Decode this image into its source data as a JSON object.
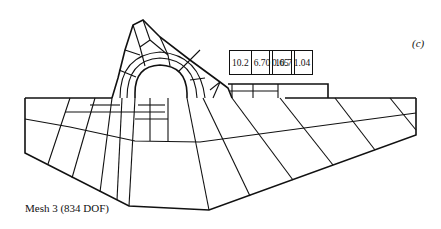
{
  "figure": {
    "panel_label": "(c)",
    "caption": "Mesh 3 (834 DOF)",
    "value_boxes": [
      {
        "cells": [
          "10.2",
          "6.70",
          "10.7"
        ]
      },
      {
        "cells": [
          "0.65",
          "1.04"
        ]
      }
    ]
  }
}
